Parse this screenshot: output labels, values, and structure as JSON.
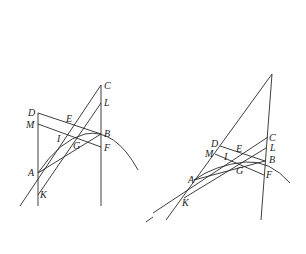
{
  "figures": [
    {
      "id": "left",
      "labels": [
        {
          "text": "C",
          "x": 104,
          "y": 89
        },
        {
          "text": "L",
          "x": 104,
          "y": 106
        },
        {
          "text": "D",
          "x": 28,
          "y": 116
        },
        {
          "text": "E",
          "x": 66,
          "y": 122
        },
        {
          "text": "M",
          "x": 26,
          "y": 128
        },
        {
          "text": "B",
          "x": 104,
          "y": 137
        },
        {
          "text": "I",
          "x": 57,
          "y": 142
        },
        {
          "text": "G",
          "x": 73,
          "y": 149
        },
        {
          "text": "F",
          "x": 104,
          "y": 151
        },
        {
          "text": "A",
          "x": 28,
          "y": 176
        },
        {
          "text": "K",
          "x": 40,
          "y": 198
        }
      ]
    },
    {
      "id": "right",
      "labels": [
        {
          "text": "C",
          "x": 269,
          "y": 141
        },
        {
          "text": "D",
          "x": 211,
          "y": 147
        },
        {
          "text": "L",
          "x": 270,
          "y": 151
        },
        {
          "text": "E",
          "x": 236,
          "y": 152
        },
        {
          "text": "M",
          "x": 205,
          "y": 157
        },
        {
          "text": "I",
          "x": 224,
          "y": 160
        },
        {
          "text": "B",
          "x": 269,
          "y": 163
        },
        {
          "text": "G",
          "x": 236,
          "y": 174
        },
        {
          "text": "F",
          "x": 266,
          "y": 178
        },
        {
          "text": "A",
          "x": 188,
          "y": 183
        },
        {
          "text": "K",
          "x": 182,
          "y": 206
        }
      ]
    }
  ]
}
